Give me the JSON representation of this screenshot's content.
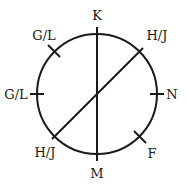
{
  "diagram": {
    "type": "circular-seating",
    "circle": {
      "cx": 97,
      "cy": 94,
      "r": 60
    },
    "stroke_color": "#1a1a1a",
    "background": "#ffffff",
    "positions": [
      {
        "id": "top",
        "label": "K",
        "label_x": 97,
        "label_y": 20
      },
      {
        "id": "top-right",
        "label": "H/J",
        "label_x": 157,
        "label_y": 40
      },
      {
        "id": "right",
        "label": "N",
        "label_x": 172,
        "label_y": 99
      },
      {
        "id": "bottom-right",
        "label": "F",
        "label_x": 152,
        "label_y": 158
      },
      {
        "id": "bottom",
        "label": "M",
        "label_x": 97,
        "label_y": 178
      },
      {
        "id": "bottom-left",
        "label": "H/J",
        "label_x": 45,
        "label_y": 157
      },
      {
        "id": "left",
        "label": "G/L",
        "label_x": 16,
        "label_y": 99
      },
      {
        "id": "top-left",
        "label": "G/L",
        "label_x": 44,
        "label_y": 40
      }
    ],
    "lines": [
      {
        "id": "vertical-diameter",
        "x1": 97,
        "y1": 27,
        "x2": 97,
        "y2": 161
      },
      {
        "id": "diagonal-diameter",
        "x1": 143,
        "y1": 48,
        "x2": 52,
        "y2": 139
      }
    ],
    "ticks": [
      {
        "id": "tick-top-left",
        "x1": 48,
        "y1": 45,
        "x2": 60,
        "y2": 57
      },
      {
        "id": "tick-left",
        "x1": 30,
        "y1": 94,
        "x2": 44,
        "y2": 94
      },
      {
        "id": "tick-right",
        "x1": 150,
        "y1": 94,
        "x2": 164,
        "y2": 94
      },
      {
        "id": "tick-bottom-right",
        "x1": 134,
        "y1": 131,
        "x2": 146,
        "y2": 143
      }
    ]
  }
}
